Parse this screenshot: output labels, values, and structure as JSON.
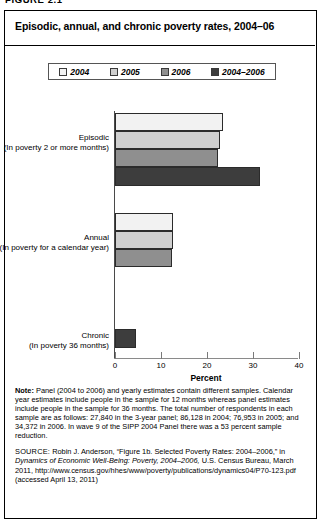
{
  "figure_number": "FIGURE 2.1",
  "title": "Episodic, annual, and chronic poverty rates, 2004–06",
  "legend": {
    "items": [
      {
        "label": "2004",
        "color": "#f2f2f2"
      },
      {
        "label": "2005",
        "color": "#cfcfcf"
      },
      {
        "label": "2006",
        "color": "#8f8f8f"
      },
      {
        "label": "2004–2006",
        "color": "#3d3d3d"
      }
    ]
  },
  "notes": {
    "label": "Note:",
    "text": "Panel (2004 to 2006) and yearly estimates contain different samples. Calendar year estimates include people in the sample for 12 months whereas panel estimates include people in the sample for 36 months. The total number of respondents in each sample are as follows: 27,840 in the 3-year panel; 86,128 in 2004; 76,953 in 2005; and 34,372 in 2006. In wave 9 of the SIPP 2004 Panel there was a 53 percent sample reduction."
  },
  "source": {
    "label": "SOURCE:",
    "text_1": "Robin J. Anderson, “Figure 1b. Selected Poverty Rates: 2004–2006,” in ",
    "text_italic": "Dynamics of Economic Well-Being: Poverty, 2004–2006,",
    "text_2": " U.S. Census Bureau, March 2011, http://www.census.gov/hhes/www/poverty/publications/dynamics04/P70-123.pdf (accessed April 13, 2011)"
  },
  "chart_data": {
    "type": "bar",
    "orientation": "horizontal",
    "title": "Episodic, annual, and chronic poverty rates, 2004–06",
    "xlabel": "Percent",
    "ylabel": "",
    "xlim": [
      0,
      40
    ],
    "xticks": [
      0,
      10,
      20,
      30,
      40
    ],
    "grid": false,
    "legend_position": "top",
    "categories": [
      "Episodic (In poverty 2 or more months)",
      "Annual (In poverty for a calendar year)",
      "Chronic (In poverty 36 months)"
    ],
    "category_labels": [
      {
        "name": "Episodic",
        "sub": "(In poverty 2 or more months)"
      },
      {
        "name": "Annual",
        "sub": "(In poverty for a calendar year)"
      },
      {
        "name": "Chronic",
        "sub": "(In poverty 36 months)"
      }
    ],
    "series": [
      {
        "name": "2004",
        "color": "#f2f2f2",
        "values": [
          23.5,
          12.7,
          null
        ]
      },
      {
        "name": "2005",
        "color": "#cfcfcf",
        "values": [
          22.8,
          12.6,
          null
        ]
      },
      {
        "name": "2006",
        "color": "#8f8f8f",
        "values": [
          22.3,
          12.3,
          null
        ]
      },
      {
        "name": "2004–2006",
        "color": "#3d3d3d",
        "values": [
          31.6,
          null,
          4.5
        ]
      }
    ],
    "bars": [
      {
        "group": 0,
        "series": "2004",
        "value": 23.5,
        "color": "#f2f2f2",
        "top": 22,
        "height": 18
      },
      {
        "group": 0,
        "series": "2005",
        "value": 22.8,
        "color": "#cfcfcf",
        "top": 40,
        "height": 18
      },
      {
        "group": 0,
        "series": "2006",
        "value": 22.3,
        "color": "#8f8f8f",
        "top": 58,
        "height": 18
      },
      {
        "group": 0,
        "series": "2004–2006",
        "value": 31.6,
        "color": "#3d3d3d",
        "top": 76,
        "height": 19
      },
      {
        "group": 1,
        "series": "2004",
        "value": 12.7,
        "color": "#f2f2f2",
        "top": 122,
        "height": 18
      },
      {
        "group": 1,
        "series": "2005",
        "value": 12.6,
        "color": "#cfcfcf",
        "top": 140,
        "height": 18
      },
      {
        "group": 1,
        "series": "2006",
        "value": 12.3,
        "color": "#8f8f8f",
        "top": 158,
        "height": 18
      },
      {
        "group": 2,
        "series": "2004–2006",
        "value": 4.5,
        "color": "#3d3d3d",
        "top": 238,
        "height": 19
      }
    ]
  }
}
